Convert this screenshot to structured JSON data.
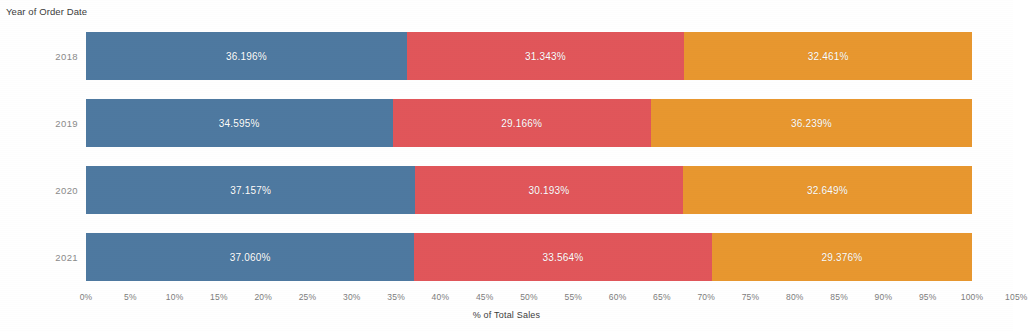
{
  "header": {
    "field_caption": "Year of Order Date"
  },
  "axis": {
    "title": "% of Total Sales",
    "ticks": [
      "0%",
      "5%",
      "10%",
      "15%",
      "20%",
      "25%",
      "30%",
      "35%",
      "40%",
      "45%",
      "50%",
      "55%",
      "60%",
      "65%",
      "70%",
      "75%",
      "80%",
      "85%",
      "90%",
      "95%",
      "100%",
      "105%"
    ],
    "tick_values": [
      0,
      5,
      10,
      15,
      20,
      25,
      30,
      35,
      40,
      45,
      50,
      55,
      60,
      65,
      70,
      75,
      80,
      85,
      90,
      95,
      100,
      105
    ]
  },
  "colors": {
    "segment_1": "#4e79a0",
    "segment_2": "#e1565a",
    "segment_3": "#e8972f",
    "background": "#ffffff",
    "label_text": "#ffffff",
    "axis_text": "#7d7d7d",
    "row_label_text": "#8a8a8a"
  },
  "chart_data": {
    "type": "bar",
    "orientation": "horizontal",
    "stacked": true,
    "stack_mode": "percent",
    "title": "",
    "subtitle": "",
    "xlabel": "% of Total Sales",
    "ylabel": "Year of Order Date",
    "xlim": [
      0,
      105
    ],
    "grid": false,
    "legend": "none",
    "categories": [
      "2018",
      "2019",
      "2020",
      "2021"
    ],
    "series": [
      {
        "name": "Segment 1",
        "color": "#4e79a0",
        "values": [
          36.196,
          34.595,
          37.157,
          37.06
        ],
        "labels": [
          "36.196%",
          "34.595%",
          "37.157%",
          "37.060%"
        ]
      },
      {
        "name": "Segment 2",
        "color": "#e1565a",
        "values": [
          31.343,
          29.166,
          30.193,
          33.564
        ],
        "labels": [
          "31.343%",
          "29.166%",
          "30.193%",
          "33.564%"
        ]
      },
      {
        "name": "Segment 3",
        "color": "#e8972f",
        "values": [
          32.461,
          36.239,
          32.649,
          29.376
        ],
        "labels": [
          "32.461%",
          "36.239%",
          "32.649%",
          "29.376%"
        ]
      }
    ]
  }
}
